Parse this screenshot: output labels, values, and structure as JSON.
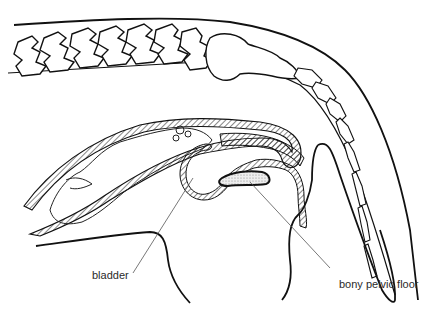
{
  "figure": {
    "colors": {
      "line": "#111111",
      "hatch": "#222222",
      "stipple": "#d8d8d8",
      "background": "#ffffff"
    }
  },
  "labels": {
    "bladder": "bladder",
    "bony_pelvic_floor": "bony pelvic floor"
  }
}
